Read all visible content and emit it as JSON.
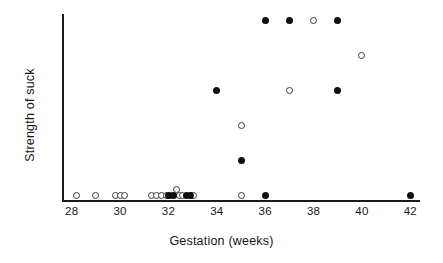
{
  "chart_data": {
    "type": "scatter",
    "title": "",
    "xlabel": "Gestation (weeks)",
    "ylabel": "Strength of suck",
    "xlim": [
      27.6,
      42.4
    ],
    "ylim": [
      -0.18,
      5.2
    ],
    "xticks": [
      28,
      30,
      32,
      34,
      36,
      38,
      40,
      42
    ],
    "yticks": [
      0,
      1,
      2,
      3,
      4,
      5
    ],
    "grid": false,
    "legend": "none",
    "series": [
      {
        "name": "open-circle",
        "marker": "open circle",
        "color": "#ffffff",
        "edge_color": "#3a3a3a",
        "points": [
          [
            28.2,
            0
          ],
          [
            29.0,
            0
          ],
          [
            29.8,
            0
          ],
          [
            30.0,
            0
          ],
          [
            30.2,
            0
          ],
          [
            31.3,
            0
          ],
          [
            31.5,
            0
          ],
          [
            31.7,
            0
          ],
          [
            31.9,
            0
          ],
          [
            32.1,
            0
          ],
          [
            32.45,
            0
          ],
          [
            32.6,
            0
          ],
          [
            32.9,
            0
          ],
          [
            33.05,
            0
          ],
          [
            32.35,
            0.18
          ],
          [
            35.0,
            0
          ],
          [
            35.0,
            2
          ],
          [
            37.0,
            3
          ],
          [
            38.0,
            5
          ],
          [
            40.0,
            4
          ]
        ]
      },
      {
        "name": "filled-circle",
        "marker": "filled circle",
        "color": "#111111",
        "points": [
          [
            32.0,
            0
          ],
          [
            32.2,
            0
          ],
          [
            32.75,
            0
          ],
          [
            32.9,
            0
          ],
          [
            34.0,
            3
          ],
          [
            35.0,
            1
          ],
          [
            36.0,
            0
          ],
          [
            36.0,
            5
          ],
          [
            37.0,
            5
          ],
          [
            39.0,
            5
          ],
          [
            39.0,
            3
          ],
          [
            42.0,
            0
          ]
        ]
      }
    ]
  }
}
